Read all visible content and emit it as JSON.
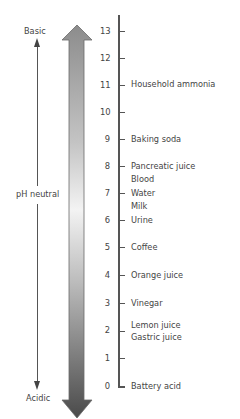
{
  "diagram": {
    "type": "pH scale",
    "left_labels": {
      "top": "Basic",
      "middle": "pH neutral",
      "bottom": "Acidic"
    },
    "gradient_arrow": {
      "top_color": "#8a8a8a",
      "middle_color": "#f2f2f2",
      "bottom_color": "#4a4a4a"
    },
    "scale": {
      "ticks": [
        {
          "value": "13",
          "labels": []
        },
        {
          "value": "12",
          "labels": []
        },
        {
          "value": "11",
          "labels": [
            "Household ammonia"
          ]
        },
        {
          "value": "10",
          "labels": []
        },
        {
          "value": "9",
          "labels": [
            "Baking soda"
          ]
        },
        {
          "value": "8",
          "labels": [
            "Pancreatic juice",
            "Blood"
          ]
        },
        {
          "value": "7",
          "labels": [
            "Water",
            "Milk"
          ]
        },
        {
          "value": "6",
          "labels": [
            "Urine"
          ]
        },
        {
          "value": "5",
          "labels": [
            "Coffee"
          ]
        },
        {
          "value": "4",
          "labels": [
            "Orange juice"
          ]
        },
        {
          "value": "3",
          "labels": [
            "Vinegar"
          ]
        },
        {
          "value": "2",
          "labels": [
            "Lemon juice",
            "Gastric juice"
          ]
        },
        {
          "value": "1",
          "labels": []
        },
        {
          "value": "0",
          "labels": [
            "Battery acid"
          ]
        }
      ]
    }
  }
}
